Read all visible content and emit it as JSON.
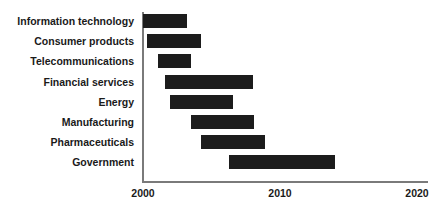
{
  "chart_data": {
    "type": "bar",
    "orientation": "horizontal",
    "subtype": "gantt-range-bar",
    "title": "",
    "subtitle": "",
    "xlabel": "",
    "ylabel": "",
    "xlim": [
      2000,
      2020
    ],
    "ylim": null,
    "grid": false,
    "legend": null,
    "xticks": [
      2000,
      2010,
      2020
    ],
    "xtick_labels": [
      "2000",
      "2010",
      "2020"
    ],
    "categories": [
      "Information technology",
      "Consumer products",
      "Telecommunications",
      "Financial services",
      "Energy",
      "Manufacturing",
      "Pharmaceuticals",
      "Government"
    ],
    "series": [
      {
        "name": "Adoption period",
        "color": "#1c1c1c",
        "ranges": [
          {
            "category": "Information technology",
            "start": 2000.0,
            "end": 2003.2
          },
          {
            "category": "Consumer products",
            "start": 2000.3,
            "end": 2004.2
          },
          {
            "category": "Telecommunications",
            "start": 2001.1,
            "end": 2003.5
          },
          {
            "category": "Financial services",
            "start": 2001.6,
            "end": 2008.0
          },
          {
            "category": "Energy",
            "start": 2002.0,
            "end": 2006.6
          },
          {
            "category": "Manufacturing",
            "start": 2003.5,
            "end": 2008.1
          },
          {
            "category": "Pharmaceuticals",
            "start": 2004.2,
            "end": 2008.9
          },
          {
            "category": "Government",
            "start": 2006.3,
            "end": 2014.0
          }
        ]
      }
    ],
    "annotations": []
  },
  "style": {
    "bar_color": "#1c1c1c",
    "axis_color": "#7a7a7a",
    "text_color": "#1a1a1a",
    "background": "#ffffff"
  }
}
